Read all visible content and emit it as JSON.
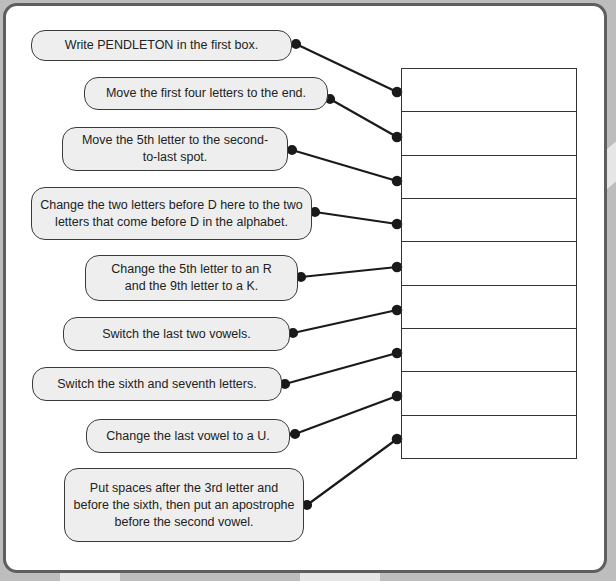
{
  "worksheet": {
    "instructions": [
      {
        "text": "Write PENDLETON in the first box."
      },
      {
        "text": "Move the first four letters to the end."
      },
      {
        "text": "Move the 5th letter to the second-to-last spot."
      },
      {
        "text": "Change the two letters before D here to the two letters that come before D in the alphabet."
      },
      {
        "text": "Change the 5th letter to an R and the 9th letter to a K."
      },
      {
        "text": "Switch the last two vowels."
      },
      {
        "text": "Switch the sixth and seventh letters."
      },
      {
        "text": "Change the last vowel to a U."
      },
      {
        "text": "Put spaces after the 3rd letter and before the sixth, then put an apostrophe before the second vowel."
      }
    ],
    "answer_boxes": [
      "",
      "",
      "",
      "",
      "",
      "",
      "",
      "",
      ""
    ],
    "colors": {
      "bubble_fill": "#eeeeee",
      "line": "#1a1a1a",
      "frame": "#5e5e5e",
      "background": "#bdbdbd"
    }
  }
}
